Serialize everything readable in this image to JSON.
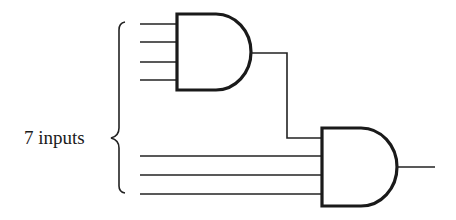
{
  "diagram": {
    "type": "logic-circuit",
    "brace_label": "7 inputs",
    "total_inputs": 7,
    "gates": [
      {
        "id": "and-gate-1",
        "type": "AND",
        "inputs": 4
      },
      {
        "id": "and-gate-2",
        "type": "AND",
        "inputs": 4,
        "note": "1 input from and-gate-1 output, 3 direct inputs"
      }
    ],
    "colors": {
      "stroke": "#1a1a1a",
      "background": "#ffffff"
    }
  }
}
